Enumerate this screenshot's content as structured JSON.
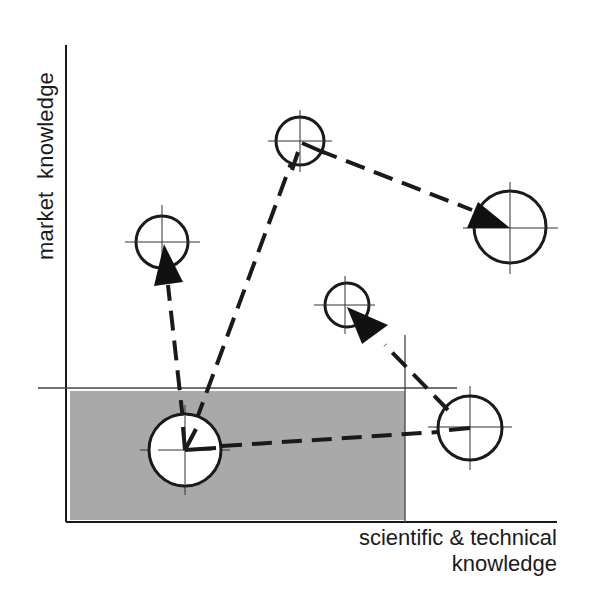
{
  "diagram": {
    "y_axis_label": "market  knowledge",
    "x_axis_label_line1": "scientific & technical",
    "x_axis_label_line2": "knowledge",
    "colors": {
      "shaded_region": "#a9a9a9",
      "line": "#1a1a1a",
      "circle_fill": "#ffffff"
    },
    "shaded_region": {
      "x": 70,
      "y": 391,
      "width": 335,
      "height": 129
    },
    "nodes": [
      {
        "id": "A",
        "cx": 185,
        "cy": 450,
        "r": 36,
        "in_shaded_region": true
      },
      {
        "id": "B",
        "cx": 162,
        "cy": 242,
        "r": 26
      },
      {
        "id": "C",
        "cx": 300,
        "cy": 141,
        "r": 24
      },
      {
        "id": "D",
        "cx": 510,
        "cy": 227,
        "r": 36
      },
      {
        "id": "E",
        "cx": 347,
        "cy": 305,
        "r": 22
      },
      {
        "id": "F",
        "cx": 470,
        "cy": 428,
        "r": 32
      }
    ],
    "paths": [
      {
        "from": "A",
        "to": "B",
        "style": "dashed",
        "arrowhead": true
      },
      {
        "from": "A",
        "to": "C",
        "style": "dashed",
        "arrowhead": false
      },
      {
        "from": "C",
        "to": "D",
        "style": "dashed",
        "arrowhead": true
      },
      {
        "from": "A",
        "to": "F",
        "style": "dashed",
        "arrowhead": false
      },
      {
        "from": "F",
        "to": "E",
        "style": "dashed",
        "arrowhead": true
      }
    ]
  }
}
